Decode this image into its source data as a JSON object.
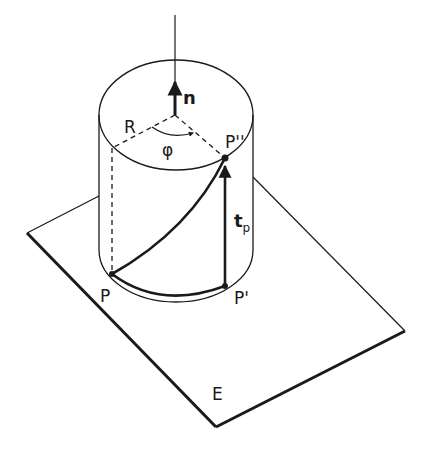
{
  "figure": {
    "labels": {
      "normal": "n",
      "radius": "R",
      "angle": "φ",
      "point_p": "P",
      "point_p_prime": "P'",
      "point_p_double_prime": "P''",
      "tangent_main": "t",
      "tangent_sub": "p",
      "plane": "E"
    },
    "colors": {
      "stroke": "#1a1a1a",
      "background": "#ffffff"
    }
  }
}
